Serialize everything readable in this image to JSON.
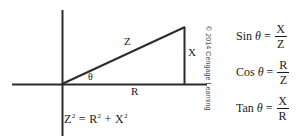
{
  "figure": {
    "background_color": "#ffffff",
    "line_color": "#2b2b2b",
    "text_color": "#1a1a1a"
  },
  "diagram": {
    "labels": {
      "hypotenuse": "Z",
      "horizontal_leg": "R",
      "vertical_leg": "X",
      "angle": "θ"
    },
    "equation": {
      "lhs_base": "Z",
      "lhs_exp": "2",
      "equals": "=",
      "rhs_first_base": "R",
      "rhs_first_exp": "2",
      "plus": "+",
      "rhs_second_base": "X",
      "rhs_second_exp": "2"
    }
  },
  "formulas": [
    {
      "function": "Sin",
      "theta": "θ",
      "equals": "=",
      "numerator": "X",
      "denominator": "Z"
    },
    {
      "function": "Cos",
      "theta": "θ",
      "equals": "=",
      "numerator": "R",
      "denominator": "Z"
    },
    {
      "function": "Tan",
      "theta": "θ",
      "equals": "=",
      "numerator": "X",
      "denominator": "R"
    }
  ],
  "copyright": {
    "text": "© 2014 Cengage Learning"
  }
}
